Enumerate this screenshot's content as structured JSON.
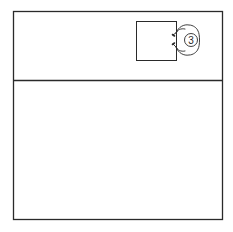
{
  "diagram": {
    "type": "floor-plan-seating",
    "colors": {
      "background": "#ffffff",
      "stroke": "#2a2a2a"
    },
    "room": {
      "x": 13,
      "y": 11,
      "width": 210,
      "height": 209
    },
    "divider": {
      "y": 80
    },
    "table": {
      "x": 136,
      "y": 21,
      "width": 41,
      "height": 40
    },
    "person": {
      "label": "3",
      "cx": 192,
      "cy": 40
    }
  }
}
